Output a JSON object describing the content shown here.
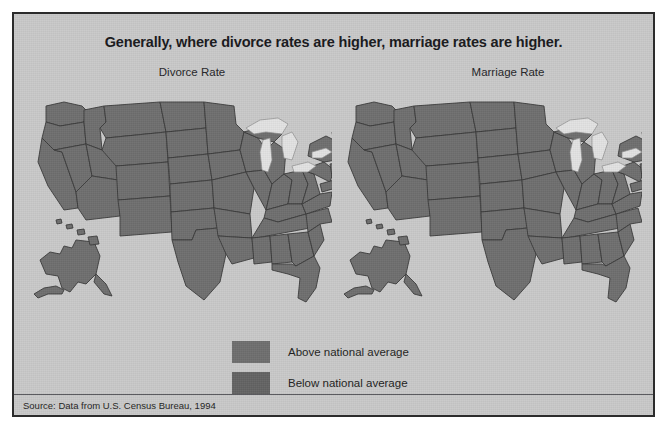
{
  "figure": {
    "title": "Generally, where divorce rates are higher, marriage rates are higher.",
    "source_note": "Source: Data from U.S. Census Bureau, 1994"
  },
  "maps": [
    {
      "id": "divorce",
      "caption": "Divorce Rate"
    },
    {
      "id": "marriage",
      "caption": "Marriage Rate"
    }
  ],
  "legend": {
    "items": [
      {
        "label": "Above national average",
        "color": "#6e6e6e"
      },
      {
        "label": "Below national average",
        "color": "#636363"
      }
    ]
  },
  "colors": {
    "panel_background": "#c9c9c9",
    "panel_border": "#2c2c2c",
    "state_fill_above": "#6e6e6e",
    "state_fill_below": "#636363",
    "state_border": "#3a3a3a",
    "lakes": "#e2e2e2",
    "title_text": "#17171a"
  }
}
